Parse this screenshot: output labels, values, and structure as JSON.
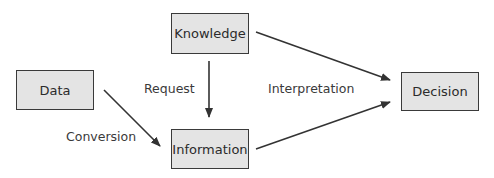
{
  "diagram": {
    "nodes": [
      {
        "id": "knowledge",
        "label": "Knowledge"
      },
      {
        "id": "data",
        "label": "Data"
      },
      {
        "id": "information",
        "label": "Information"
      },
      {
        "id": "decision",
        "label": "Decision"
      }
    ],
    "edges": [
      {
        "from": "knowledge",
        "to": "information",
        "label": "Request"
      },
      {
        "from": "data",
        "to": "information",
        "label": "Conversion"
      },
      {
        "from": "knowledge",
        "to": "decision",
        "label": "Interpretation"
      },
      {
        "from": "information",
        "to": "decision",
        "label": "Interpretation"
      }
    ],
    "edge_labels": {
      "request": "Request",
      "conversion": "Conversion",
      "interpretation": "Interpretation"
    }
  }
}
